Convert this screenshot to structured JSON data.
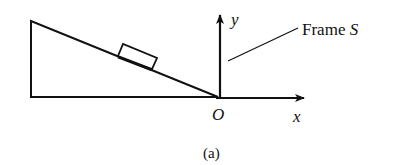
{
  "figure": {
    "caption": "(a)",
    "frame_label": {
      "prefix": "Frame ",
      "symbol": "S"
    },
    "axes": {
      "x_label": "x",
      "y_label": "y",
      "origin_label": "O"
    },
    "objects": {
      "incline": "inclined plane (wedge)",
      "block": "block on incline"
    },
    "colors": {
      "ink": "#111111",
      "background": "#ffffff"
    }
  }
}
